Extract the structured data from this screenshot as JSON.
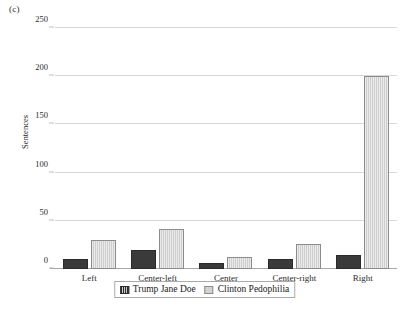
{
  "figure": {
    "panel_letter": "(c)"
  },
  "chart_data": {
    "type": "bar",
    "title": "",
    "xlabel": "",
    "ylabel": "Sentences",
    "categories": [
      "Left",
      "Center-left",
      "Center",
      "Center-right",
      "Right"
    ],
    "series": [
      {
        "name": "Trump Jane Doe",
        "values": [
          10,
          20,
          6,
          10,
          15
        ],
        "color": "#3a3a3a"
      },
      {
        "name": "Clinton Pedophilia",
        "values": [
          30,
          41,
          12,
          26,
          200
        ],
        "color": "#d2d2d2"
      }
    ],
    "ylim": [
      0,
      250
    ],
    "yticks": [
      0,
      50,
      100,
      150,
      200,
      250
    ],
    "ytick_labels": [
      "0",
      "50",
      "100",
      "150",
      "200",
      "250"
    ],
    "grid": true,
    "legend_position": "bottom"
  },
  "legend": {
    "entries": [
      {
        "label": "Trump Jane Doe",
        "swatch": "series-a-swatch"
      },
      {
        "label": "Clinton Pedophilia",
        "swatch": "series-b-swatch"
      }
    ]
  }
}
